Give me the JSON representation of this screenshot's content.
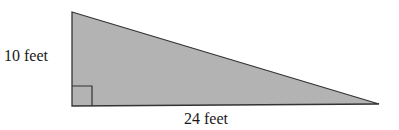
{
  "diagram": {
    "shape": "right-triangle",
    "fill_color": "#b3b3b3",
    "stroke_color": "#333333",
    "height_label": "10 feet",
    "base_label": "24 feet",
    "right_angle_marker": true
  }
}
